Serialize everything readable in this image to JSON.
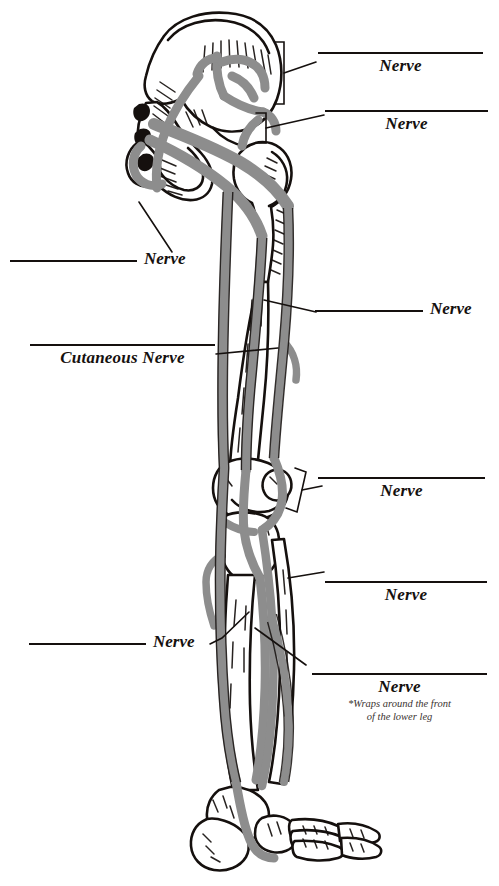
{
  "document": {
    "title": "Lower Limb Nerve Labeling Worksheet",
    "ink_color": "#15100e",
    "nerve_color": "#8d8d8d",
    "bone_fill": "#ffffff",
    "background": "#ffffff"
  },
  "figure": {
    "name": "posterior-lower-limb-nerves",
    "parts": [
      "ilium",
      "sacrum",
      "ischium",
      "femur-head",
      "greater-trochanter",
      "femur-shaft",
      "femoral-condyles",
      "patella",
      "tibia",
      "fibula",
      "tarsals",
      "metatarsals",
      "phalanges",
      "calcaneus"
    ]
  },
  "labels": [
    {
      "id": "label-right-1",
      "side": "right",
      "style": "stacked",
      "word": "Nerve",
      "blank": true,
      "connector": "bracket",
      "footnote": null
    },
    {
      "id": "label-right-2",
      "side": "right",
      "style": "stacked",
      "word": "Nerve",
      "blank": true,
      "connector": "bracket",
      "footnote": null
    },
    {
      "id": "label-left-1",
      "side": "left",
      "style": "inline",
      "word": "Nerve",
      "blank": true,
      "connector": "leader",
      "footnote": null
    },
    {
      "id": "label-right-3",
      "side": "right",
      "style": "inline",
      "word": "Nerve",
      "blank": true,
      "connector": "leader",
      "footnote": null
    },
    {
      "id": "label-left-2",
      "side": "left",
      "style": "stacked",
      "word": "Cutaneous Nerve",
      "blank": true,
      "connector": "leader",
      "footnote": null
    },
    {
      "id": "label-right-4",
      "side": "right",
      "style": "stacked",
      "word": "Nerve",
      "blank": true,
      "connector": "bracket",
      "footnote": null
    },
    {
      "id": "label-right-5",
      "side": "right",
      "style": "stacked",
      "word": "Nerve",
      "blank": true,
      "connector": "leader",
      "footnote": null
    },
    {
      "id": "label-left-3",
      "side": "left",
      "style": "inline",
      "word": "Nerve",
      "blank": true,
      "connector": "leader",
      "footnote": null
    },
    {
      "id": "label-right-6",
      "side": "right",
      "style": "stacked",
      "word": "Nerve",
      "blank": true,
      "connector": "leader",
      "footnote": {
        "line1": "*Wraps around the front",
        "line2": "of the lower leg"
      }
    }
  ]
}
